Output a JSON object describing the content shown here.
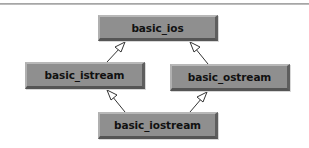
{
  "diagram": {
    "type": "class-inheritance",
    "colors": {
      "node_fill": "#8f8f8f",
      "node_text": "#111111",
      "edge": "#333333",
      "arrowhead_fill": "#ffffff"
    },
    "nodes": [
      {
        "id": "basic_ios",
        "label": "basic_ios",
        "x": 98,
        "y": 15,
        "w": 120,
        "h": 26
      },
      {
        "id": "basic_istream",
        "label": "basic_istream",
        "x": 25,
        "y": 62,
        "w": 120,
        "h": 27
      },
      {
        "id": "basic_ostream",
        "label": "basic_ostream",
        "x": 170,
        "y": 64,
        "w": 120,
        "h": 27
      },
      {
        "id": "basic_iostream",
        "label": "basic_iostream",
        "x": 98,
        "y": 112,
        "w": 120,
        "h": 27
      }
    ],
    "edges": [
      {
        "from": "basic_istream",
        "to": "basic_ios",
        "style": "inheritance"
      },
      {
        "from": "basic_ostream",
        "to": "basic_ios",
        "style": "inheritance"
      },
      {
        "from": "basic_iostream",
        "to": "basic_istream",
        "style": "inheritance"
      },
      {
        "from": "basic_iostream",
        "to": "basic_ostream",
        "style": "inheritance"
      }
    ]
  }
}
